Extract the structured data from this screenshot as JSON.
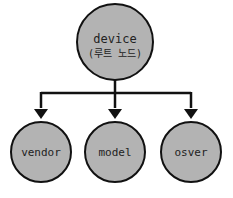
{
  "diagram": {
    "root": {
      "label": "device",
      "sublabel": "(루트 노드)"
    },
    "children": [
      {
        "label": "vendor"
      },
      {
        "label": "model"
      },
      {
        "label": "osver"
      }
    ],
    "colors": {
      "node_fill": "#b3b3b3",
      "stroke": "#111111",
      "background": "#ffffff"
    }
  }
}
